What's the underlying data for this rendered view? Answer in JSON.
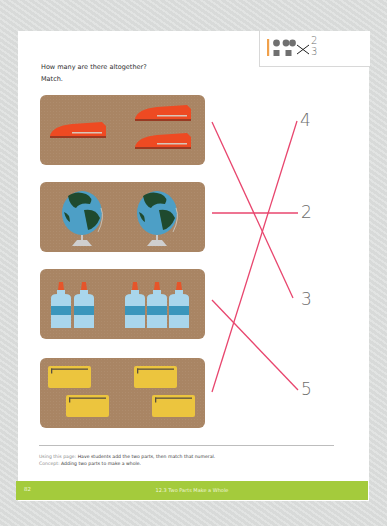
{
  "page": {
    "instructions": {
      "question": "How many are there altogether?",
      "command": "Match."
    },
    "corner_icon": {
      "description": "pencil-and-counters-matching-icon",
      "numbers": [
        "2",
        "3"
      ]
    },
    "panels": [
      {
        "name": "staplers",
        "item": "stapler",
        "group_a": 1,
        "group_b": 2,
        "total": 3
      },
      {
        "name": "globes",
        "item": "globe",
        "group_a": 1,
        "group_b": 1,
        "total": 2
      },
      {
        "name": "glue-bottles",
        "item": "glue-bottle",
        "group_a": 2,
        "group_b": 3,
        "total": 5
      },
      {
        "name": "folders",
        "item": "folder",
        "group_a": 2,
        "group_b": 2,
        "total": 4
      }
    ],
    "numerals": [
      "4",
      "2",
      "3",
      "5"
    ],
    "matches": [
      {
        "from": "staplers",
        "to": "3"
      },
      {
        "from": "globes",
        "to": "2"
      },
      {
        "from": "glue-bottles",
        "to": "5"
      },
      {
        "from": "folders",
        "to": "4"
      }
    ],
    "footnote": {
      "using_label": "Using this page:",
      "using_text": "Have students add the two parts, then match that numeral.",
      "concept_label": "Concept:",
      "concept_text": "Adding two parts to make a whole."
    },
    "footer": {
      "page_number": "82",
      "lesson_title": "12.3  Two Parts Make a Whole"
    }
  },
  "colors": {
    "line": "#e8466e",
    "panel": "#a98564",
    "footer": "#a4cb3c",
    "stapler": "#ee4a22",
    "globe_water": "#4d9fc6",
    "globe_land": "#1f4a2e",
    "glue_body": "#a9d6ec",
    "glue_band": "#3a96bc",
    "glue_cap": "#e6552a",
    "folder": "#ecc53e"
  }
}
